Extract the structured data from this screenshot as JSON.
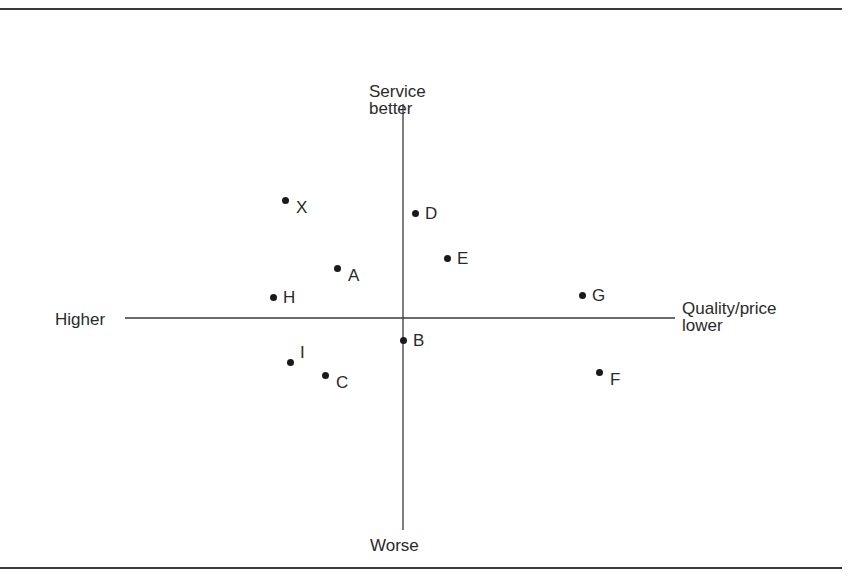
{
  "chart_data": {
    "type": "scatter",
    "title": "",
    "xlabel": "Quality/price",
    "ylabel": "Service",
    "axis_labels": {
      "top": [
        "Service",
        "better"
      ],
      "bottom": [
        "Worse"
      ],
      "left": [
        "Higher"
      ],
      "right": [
        "Quality/price",
        "lower"
      ]
    },
    "axis_style": "crosshair (quadrant) axes, no ticks, no gridlines",
    "xlim": [
      -28,
      27
    ],
    "ylim": [
      -21,
      21
    ],
    "grid": false,
    "legend": null,
    "points": [
      {
        "label": "X",
        "x": -11.8,
        "y": 11.8,
        "label_pos": "right-below"
      },
      {
        "label": "D",
        "x": 1.2,
        "y": 10.5,
        "label_pos": "right"
      },
      {
        "label": "E",
        "x": 4.4,
        "y": 6.0,
        "label_pos": "right"
      },
      {
        "label": "A",
        "x": -6.6,
        "y": 5.0,
        "label_pos": "right-below"
      },
      {
        "label": "H",
        "x": -13.0,
        "y": 2.1,
        "label_pos": "right"
      },
      {
        "label": "G",
        "x": 17.9,
        "y": 2.3,
        "label_pos": "right"
      },
      {
        "label": "B",
        "x": 0.0,
        "y": -2.2,
        "label_pos": "right"
      },
      {
        "label": "I",
        "x": -11.3,
        "y": -4.4,
        "label_pos": "right-above"
      },
      {
        "label": "C",
        "x": -7.8,
        "y": -5.7,
        "label_pos": "right-below"
      },
      {
        "label": "F",
        "x": 19.6,
        "y": -5.4,
        "label_pos": "right-below"
      }
    ]
  },
  "layout": {
    "origin_px": [
      403,
      318
    ],
    "px_per_unit": 10,
    "h_axis_px": [
      125,
      675
    ],
    "v_axis_px": [
      104,
      530
    ],
    "colors": {
      "axis": "#3a3a3a",
      "dot": "#1a1a1a",
      "text": "#2a2a2a",
      "background": "#ffffff"
    }
  }
}
